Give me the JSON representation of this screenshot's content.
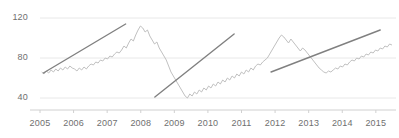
{
  "chart_data": {
    "type": "line",
    "title": "",
    "subtitle": "",
    "xlabel": "",
    "ylabel": "",
    "grid": true,
    "legend_position": "none",
    "xlim": [
      2005.0,
      2015.6
    ],
    "ylim": [
      28,
      126
    ],
    "yticks": [
      40,
      80,
      120
    ],
    "ytick_labels": [
      "40",
      "80",
      "120"
    ],
    "xticks": [
      2005,
      2006,
      2007,
      2008,
      2009,
      2010,
      2011,
      2012,
      2013,
      2014,
      2015
    ],
    "xtick_labels": [
      "2005",
      "2006",
      "2007",
      "2008",
      "2009",
      "2010",
      "2011",
      "2012",
      "2013",
      "2014",
      "2015"
    ],
    "series": [
      {
        "name": "price",
        "color": "#b9b9b9",
        "x": [
          2005.05,
          2005.12,
          2005.19,
          2005.26,
          2005.33,
          2005.4,
          2005.47,
          2005.54,
          2005.61,
          2005.68,
          2005.75,
          2005.82,
          2005.89,
          2005.96,
          2006.03,
          2006.1,
          2006.17,
          2006.24,
          2006.31,
          2006.38,
          2006.45,
          2006.52,
          2006.59,
          2006.66,
          2006.73,
          2006.8,
          2006.87,
          2006.94,
          2007.01,
          2007.08,
          2007.15,
          2007.22,
          2007.29,
          2007.36,
          2007.43,
          2007.5,
          2007.57,
          2007.64,
          2007.71,
          2007.78,
          2007.85,
          2007.92,
          2007.99,
          2008.06,
          2008.13,
          2008.2,
          2008.27,
          2008.34,
          2008.41,
          2008.48,
          2008.55,
          2008.62,
          2008.69,
          2008.76,
          2008.83,
          2008.9,
          2008.97,
          2009.04,
          2009.11,
          2009.18,
          2009.25,
          2009.32,
          2009.39,
          2009.46,
          2009.53,
          2009.6,
          2009.67,
          2009.74,
          2009.81,
          2009.88,
          2009.95,
          2010.02,
          2010.09,
          2010.16,
          2010.23,
          2010.3,
          2010.37,
          2010.44,
          2010.51,
          2010.58,
          2010.65,
          2010.72,
          2010.79,
          2010.86,
          2010.93,
          2011.0,
          2011.07,
          2011.14,
          2011.21,
          2011.28,
          2011.35,
          2011.42,
          2011.49,
          2011.56,
          2011.63,
          2011.7,
          2011.77,
          2011.84,
          2011.91,
          2011.98,
          2012.05,
          2012.12,
          2012.19,
          2012.26,
          2012.33,
          2012.4,
          2012.47,
          2012.54,
          2012.61,
          2012.68,
          2012.75,
          2012.82,
          2012.89,
          2012.96,
          2013.03,
          2013.1,
          2013.17,
          2013.24,
          2013.31,
          2013.38,
          2013.45,
          2013.52,
          2013.59,
          2013.66,
          2013.73,
          2013.8,
          2013.87,
          2013.94,
          2014.01,
          2014.08,
          2014.15,
          2014.22,
          2014.29,
          2014.36,
          2014.43,
          2014.5,
          2014.57,
          2014.64,
          2014.71,
          2014.78,
          2014.85,
          2014.92,
          2014.99,
          2015.06,
          2015.13,
          2015.2,
          2015.27,
          2015.34,
          2015.41,
          2015.48
        ],
        "y": [
          66,
          64,
          67,
          65,
          68,
          66,
          69,
          67,
          70,
          68,
          71,
          69,
          72,
          70,
          69,
          67,
          70,
          68,
          71,
          69,
          72,
          74,
          73,
          76,
          75,
          78,
          77,
          80,
          79,
          82,
          81,
          84,
          86,
          85,
          88,
          92,
          90,
          95,
          99,
          97,
          103,
          108,
          112,
          110,
          106,
          108,
          102,
          98,
          94,
          96,
          90,
          86,
          82,
          78,
          72,
          66,
          62,
          58,
          54,
          50,
          46,
          42,
          40,
          44,
          42,
          46,
          44,
          48,
          46,
          50,
          48,
          52,
          50,
          54,
          52,
          56,
          54,
          58,
          56,
          60,
          58,
          62,
          60,
          64,
          62,
          66,
          64,
          68,
          66,
          70,
          68,
          72,
          74,
          73,
          76,
          78,
          80,
          84,
          88,
          92,
          96,
          100,
          103,
          101,
          98,
          95,
          99,
          96,
          93,
          90,
          87,
          90,
          88,
          85,
          82,
          79,
          76,
          73,
          70,
          68,
          66,
          65,
          67,
          66,
          68,
          70,
          69,
          72,
          71,
          74,
          73,
          76,
          78,
          77,
          80,
          79,
          82,
          81,
          84,
          83,
          86,
          85,
          88,
          87,
          90,
          89,
          92,
          91,
          94,
          93
        ],
        "y_note": "approximate monthly index values read from the plot"
      }
    ],
    "trendlines": [
      {
        "name": "trend-2005-2007",
        "x0": 2005.1,
        "y0": 65,
        "x1": 2007.55,
        "y1": 114,
        "color": "#808080"
      },
      {
        "name": "trend-2008-2011",
        "x0": 2008.42,
        "y0": 41,
        "x1": 2010.78,
        "y1": 104,
        "color": "#808080"
      },
      {
        "name": "trend-2012-2015",
        "x0": 2011.88,
        "y0": 66,
        "x1": 2015.13,
        "y1": 108,
        "color": "#808080"
      }
    ],
    "annotations": []
  },
  "axis": {
    "y_labels": [
      "120",
      "80",
      "40"
    ],
    "x_labels": [
      "2005",
      "2006",
      "2007",
      "2008",
      "2009",
      "2010",
      "2011",
      "2012",
      "2013",
      "2014",
      "2015"
    ]
  },
  "colors": {
    "series": "#b9b9b9",
    "trend": "#808080",
    "grid": "#e8e8e8",
    "axis": "#d0d0d0",
    "text": "#6f6f6f",
    "background": "#ffffff"
  }
}
